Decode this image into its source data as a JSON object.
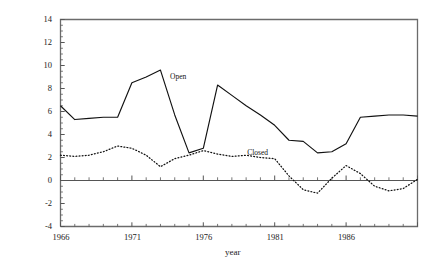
{
  "chart_data": {
    "type": "line",
    "title": "",
    "subtitle": "",
    "xlabel": "year",
    "ylabel": "",
    "xlim": [
      1966,
      1991
    ],
    "ylim": [
      -4,
      14
    ],
    "grid": false,
    "legend_position": "inline-annotation",
    "x_tick_labels": [
      "1966",
      "1971",
      "1976",
      "1981",
      "1986"
    ],
    "x_tick_values": [
      1966,
      1971,
      1976,
      1981,
      1986
    ],
    "x_minor_tick_interval": 1,
    "y_tick_labels": [
      "14",
      "12",
      "10",
      "8",
      "6",
      "4",
      "2",
      "0",
      "-2",
      "-4"
    ],
    "y_tick_values": [
      14,
      12,
      10,
      8,
      6,
      4,
      2,
      0,
      -2,
      -4
    ],
    "y_minor_tick_interval": 0.5,
    "zero_line": 0,
    "x": [
      1966,
      1967,
      1968,
      1969,
      1970,
      1971,
      1972,
      1973,
      1974,
      1975,
      1976,
      1977,
      1978,
      1979,
      1980,
      1981,
      1982,
      1983,
      1984,
      1985,
      1986,
      1987,
      1988,
      1989,
      1990,
      1991
    ],
    "series": [
      {
        "name": "Open",
        "style": "solid",
        "color": "#111111",
        "annotation": "Open",
        "values": [
          6.5,
          5.3,
          5.4,
          5.5,
          5.5,
          8.5,
          9.0,
          9.6,
          5.7,
          2.4,
          2.8,
          8.3,
          7.4,
          6.5,
          5.7,
          4.8,
          3.5,
          3.4,
          2.4,
          2.5,
          3.2,
          5.5,
          5.6,
          5.7,
          5.7,
          5.6
        ]
      },
      {
        "name": "Closed",
        "style": "dotted",
        "color": "#111111",
        "annotation": "Closed",
        "values": [
          2.2,
          2.1,
          2.2,
          2.5,
          3.0,
          2.8,
          2.2,
          1.2,
          1.9,
          2.2,
          2.6,
          2.3,
          2.1,
          2.2,
          2.0,
          1.9,
          0.4,
          -0.8,
          -1.1,
          0.2,
          1.3,
          0.6,
          -0.5,
          -0.9,
          -0.7,
          0.1
        ]
      }
    ],
    "annotations": [
      {
        "text": "Open",
        "x": 1973.6,
        "y": 9.0
      },
      {
        "text": "Closed",
        "x": 1979.0,
        "y": 2.4
      }
    ],
    "colors": {
      "axis": "#555555",
      "frame": "#6b6b6b",
      "line": "#111111",
      "background": "#ffffff",
      "text": "#1a1a1a"
    }
  }
}
